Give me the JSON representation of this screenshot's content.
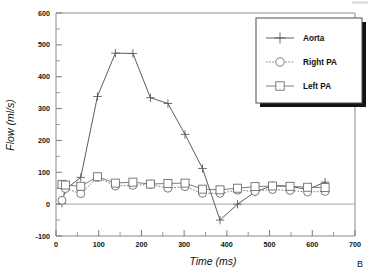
{
  "figure": {
    "panel_label": "B",
    "background": "#ffffff"
  },
  "axes": {
    "x_title": "Time (ms)",
    "y_title": "Flow (ml/s)",
    "x_ticks": [
      "0",
      "100",
      "200",
      "300",
      "400",
      "500",
      "600",
      "700"
    ],
    "y_ticks": [
      "600",
      "500",
      "400",
      "300",
      "200",
      "100",
      "0",
      "-100"
    ]
  },
  "legend": {
    "items": [
      {
        "label": "Aorta",
        "marker": "plus-star-marker",
        "line": "solid",
        "color": "#4a4a4a"
      },
      {
        "label": "Right PA",
        "marker": "circle-marker",
        "line": "dotted",
        "color": "#6d6d6d"
      },
      {
        "label": "Left PA",
        "marker": "square-marker",
        "line": "solid",
        "color": "#6d6d6d"
      }
    ]
  },
  "chart_data": {
    "type": "line",
    "title": "",
    "xlabel": "Time (ms)",
    "ylabel": "Flow (ml/s)",
    "xlim": [
      0,
      700
    ],
    "ylim": [
      -100,
      600
    ],
    "xticks": [
      0,
      100,
      200,
      300,
      400,
      500,
      600,
      700
    ],
    "yticks": [
      -100,
      0,
      100,
      200,
      300,
      400,
      500,
      600
    ],
    "x_minor_step": 50,
    "y_minor_step": 50,
    "grid": false,
    "legend_position": "upper right",
    "zero_reference_line": 0,
    "series": [
      {
        "name": "Aorta",
        "marker": "plus",
        "linestyle": "solid",
        "color": "#4a4a4a",
        "x": [
          14,
          22,
          58,
          97,
          139,
          180,
          221,
          262,
          302,
          343,
          384,
          425,
          466,
          507,
          548,
          589,
          630
        ],
        "y": [
          3,
          46,
          84,
          338,
          474,
          473,
          334,
          316,
          219,
          112,
          -50,
          0,
          38,
          59,
          56,
          46,
          69
        ]
      },
      {
        "name": "Right PA",
        "marker": "circle",
        "linestyle": "dotted",
        "color": "#6d6d6d",
        "x": [
          14,
          22,
          58,
          97,
          139,
          180,
          221,
          262,
          302,
          343,
          384,
          425,
          466,
          507,
          548,
          589,
          630
        ],
        "y": [
          12,
          49,
          33,
          84,
          57,
          59,
          62,
          50,
          55,
          34,
          34,
          44,
          40,
          46,
          43,
          38,
          40
        ]
      },
      {
        "name": "Left PA",
        "marker": "square",
        "linestyle": "solid",
        "color": "#6d6d6d",
        "x": [
          14,
          22,
          58,
          97,
          139,
          180,
          221,
          262,
          302,
          343,
          384,
          425,
          466,
          507,
          548,
          589,
          630
        ],
        "y": [
          62,
          60,
          56,
          86,
          66,
          69,
          63,
          65,
          66,
          47,
          45,
          50,
          55,
          57,
          56,
          53,
          52
        ]
      }
    ]
  }
}
